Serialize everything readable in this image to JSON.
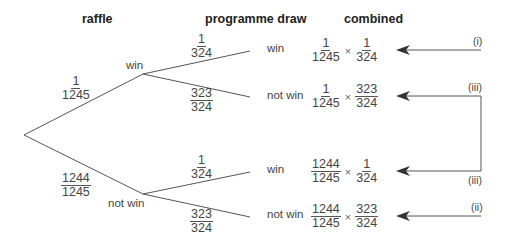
{
  "headers": {
    "raffle": "raffle",
    "programme": "programme draw",
    "combined": "combined"
  },
  "raffle": {
    "win": {
      "label": "win",
      "num": "1",
      "den": "1245"
    },
    "not_win": {
      "label": "not win",
      "num": "1244",
      "den": "1245"
    }
  },
  "programme": {
    "win_win": {
      "label": "win",
      "num": "1",
      "den": "324"
    },
    "win_not": {
      "label": "not win",
      "num": "323",
      "den": "324"
    },
    "not_win": {
      "label": "win",
      "num": "1",
      "den": "324"
    },
    "not_not": {
      "label": "not win",
      "num": "323",
      "den": "324"
    }
  },
  "combined": [
    {
      "a_num": "1",
      "a_den": "1245",
      "op": "×",
      "b_num": "1",
      "b_den": "324"
    },
    {
      "a_num": "1",
      "a_den": "1245",
      "op": "×",
      "b_num": "323",
      "b_den": "324"
    },
    {
      "a_num": "1244",
      "a_den": "1245",
      "op": "×",
      "b_num": "1",
      "b_den": "324"
    },
    {
      "a_num": "1244",
      "a_den": "1245",
      "op": "×",
      "b_num": "323",
      "b_den": "324"
    }
  ],
  "annotations": {
    "i": "(i)",
    "iii_top": "(iii)",
    "iii_bottom": "(iii)",
    "ii": "(ii)"
  },
  "colors": {
    "line": "#555555",
    "text": "#444444"
  }
}
